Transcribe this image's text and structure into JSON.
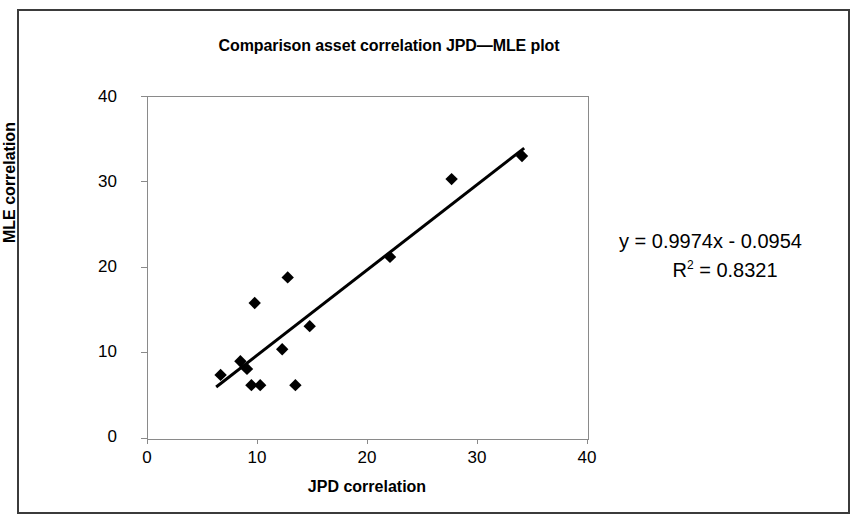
{
  "figure": {
    "title": "Comparison asset correlation JPD—MLE plot",
    "frame_color": "#3b3b3b",
    "background": "#ffffff"
  },
  "annotation": {
    "equation": "y = 0.9974x - 0.0954",
    "r_squared_prefix": "R",
    "r_squared_exponent": "2",
    "r_squared_value": "= 0.8321"
  },
  "chart_data": {
    "type": "scatter",
    "title": "Comparison asset correlation JPD—MLE plot",
    "xlabel": "JPD correlation",
    "ylabel": "MLE correlation",
    "xlim": [
      0,
      40
    ],
    "ylim": [
      0,
      40
    ],
    "xticks": [
      0,
      10,
      20,
      30,
      40
    ],
    "yticks": [
      0,
      10,
      20,
      30,
      40
    ],
    "xtick_labels": [
      "0",
      "10",
      "20",
      "30",
      "40"
    ],
    "ytick_labels": [
      "0",
      "10",
      "20",
      "30",
      "40"
    ],
    "grid": false,
    "legend": false,
    "marker": "diamond",
    "marker_color": "#000000",
    "points": [
      {
        "x": 6.6,
        "y": 7.5
      },
      {
        "x": 8.4,
        "y": 9.1
      },
      {
        "x": 9.0,
        "y": 8.2
      },
      {
        "x": 9.4,
        "y": 6.3
      },
      {
        "x": 9.7,
        "y": 15.9
      },
      {
        "x": 10.2,
        "y": 6.3
      },
      {
        "x": 12.2,
        "y": 10.5
      },
      {
        "x": 12.7,
        "y": 18.9
      },
      {
        "x": 13.4,
        "y": 6.3
      },
      {
        "x": 14.7,
        "y": 13.2
      },
      {
        "x": 22.0,
        "y": 21.3
      },
      {
        "x": 27.6,
        "y": 30.4
      },
      {
        "x": 34.0,
        "y": 33.1
      }
    ],
    "trendline": {
      "type": "linear",
      "slope": 0.9974,
      "intercept": -0.0954,
      "r_squared": 0.8321,
      "x_start": 6.2,
      "x_end": 34.2,
      "color": "#000000",
      "width": 3
    }
  }
}
